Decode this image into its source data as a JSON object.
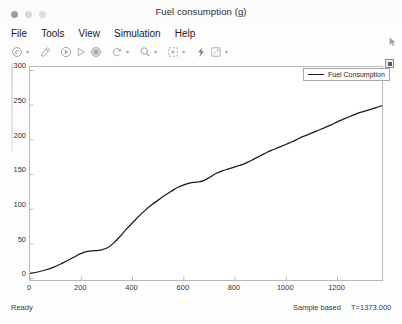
{
  "window": {
    "title": "Fuel consumption (g)",
    "traffic_lights": [
      {
        "name": "close",
        "color": "#9b9b9b"
      },
      {
        "name": "minimize",
        "color": "#d9d9d9"
      },
      {
        "name": "maximize",
        "color": "#dedede"
      }
    ]
  },
  "menubar": {
    "items": [
      {
        "label": "File"
      },
      {
        "label": "Tools"
      },
      {
        "label": "View"
      },
      {
        "label": "Simulation"
      },
      {
        "label": "Help"
      }
    ]
  },
  "toolbar": {
    "buttons": [
      {
        "name": "print-icon",
        "caret": true
      },
      {
        "name": "configuration-properties-icon",
        "caret": false
      },
      {
        "name": "highlight-signal-icon",
        "caret": false
      },
      {
        "name": "run-icon",
        "caret": false
      },
      {
        "name": "stop-icon",
        "caret": false
      },
      {
        "name": "step-forward-icon",
        "caret": true
      },
      {
        "name": "zoom-icon",
        "caret": true
      },
      {
        "name": "autoscale-icon",
        "caret": true
      },
      {
        "name": "cursor-measurements-icon",
        "caret": false
      },
      {
        "name": "annotate-icon",
        "caret": true
      }
    ]
  },
  "plot_corner_button": {
    "name": "maximize-axes-button"
  },
  "legend": {
    "entries": [
      {
        "label": "Fuel Consumption",
        "color": "#1a1a1a"
      }
    ]
  },
  "statusbar": {
    "ready": "Ready",
    "mode": "Sample based",
    "time": "T=1373.000"
  },
  "chart_data": {
    "type": "line",
    "title": "Fuel consumption (g)",
    "xlabel": "",
    "ylabel": "",
    "grid": false,
    "legend_position": "top-right",
    "xlim": [
      0,
      1373
    ],
    "ylim": [
      -10,
      310
    ],
    "xticks": [
      0,
      200,
      400,
      600,
      800,
      1000,
      1200
    ],
    "xtick_labels": [
      "0",
      "200",
      "400",
      "600",
      "800",
      "1000",
      "1200"
    ],
    "yticks": [
      0,
      50,
      100,
      150,
      200,
      250,
      300
    ],
    "ytick_labels": [
      "0",
      "50",
      "100",
      "150",
      "200",
      "250",
      "300"
    ],
    "series": [
      {
        "name": "Fuel Consumption",
        "color": "#1a1a1a",
        "x": [
          0,
          30,
          60,
          90,
          120,
          150,
          175,
          200,
          225,
          250,
          275,
          300,
          325,
          350,
          375,
          400,
          425,
          450,
          475,
          500,
          525,
          550,
          575,
          600,
          625,
          650,
          675,
          700,
          725,
          750,
          775,
          800,
          825,
          850,
          875,
          900,
          925,
          950,
          975,
          1000,
          1025,
          1050,
          1075,
          1100,
          1125,
          1150,
          1175,
          1200,
          1225,
          1250,
          1275,
          1300,
          1325,
          1350,
          1373
        ],
        "y": [
          0,
          2,
          5,
          9,
          14,
          20,
          25,
          30,
          33,
          34,
          35,
          38,
          45,
          55,
          66,
          76,
          86,
          95,
          103,
          110,
          117,
          123,
          129,
          133,
          136,
          137,
          139,
          144,
          150,
          154,
          157,
          160,
          163,
          167,
          172,
          177,
          182,
          186,
          190,
          194,
          198,
          203,
          207,
          211,
          215,
          219,
          223,
          228,
          232,
          236,
          240,
          243,
          246,
          249,
          252
        ]
      }
    ]
  }
}
